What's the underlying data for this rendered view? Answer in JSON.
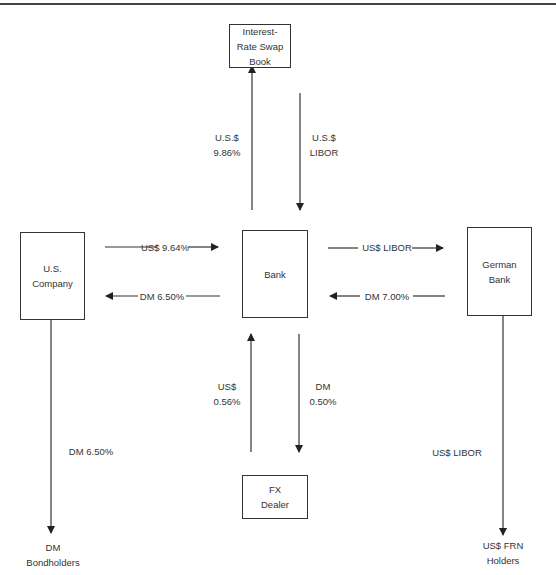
{
  "diagram": {
    "nodes": {
      "swap_book": "Interest-\nRate Swap\nBook",
      "us_company": "U.S.\nCompany",
      "bank": "Bank",
      "german_bank": "German\nBank",
      "fx_dealer": "FX\nDealer",
      "dm_bondholders": "DM Bondholders",
      "frn_holders": "US$ FRN\nHolders"
    },
    "flows": {
      "bank_to_swap": "U.S.$\n9.86%",
      "swap_to_bank": "U.S.$\nLIBOR",
      "uscompany_to_bank": "US$ 9.64%",
      "bank_to_uscompany": "DM 6.50%",
      "bank_to_german": "US$ LIBOR",
      "german_to_bank": "DM 7.00%",
      "fx_to_bank": "US$\n0.56%",
      "bank_to_fx": "DM\n0.50%",
      "uscompany_to_bondholders": "DM 6.50%",
      "german_to_frn": "US$ LIBOR"
    },
    "colors": {
      "line": "#333333",
      "text": "#333333"
    }
  }
}
